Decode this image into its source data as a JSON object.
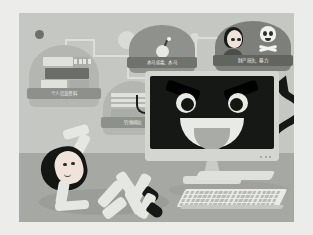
{
  "illustration": {
    "title": "Cyber crime / personal data theft awareness illustration",
    "scene": {
      "wall_color": "#c5c7c3",
      "floor_color": "#a6a8a4",
      "border_color": "#ececeb"
    },
    "monitor": {
      "name": "computer-monitor",
      "screen_color": "#161815",
      "frame_color": "#d4d6d1",
      "face": "evil-grinning-face",
      "eye_count": 2,
      "led_count": 3
    },
    "devil_tail": {
      "name": "devil-tail",
      "color": "#161815"
    },
    "badges": [
      {
        "id": "personal-data",
        "icon": "documents-and-card-icon",
        "label": "个人信息资料",
        "bubble_color": "#b4b6b2",
        "banner_color": "#8e908b"
      },
      {
        "id": "phishing",
        "icon": "fishing-hook-icon",
        "label": "钓鱼网站",
        "bubble_color": "#b4b6b2",
        "banner_color": "#8e908b"
      },
      {
        "id": "malware",
        "icon": "bomb-icon",
        "label": "木马病毒、木马",
        "bubble_color": "#9a9c97",
        "banner_color": "#6f726d"
      },
      {
        "id": "victim-harm",
        "icon": "skull-and-victim-icon",
        "label": "财产损失、暴力",
        "bubble_color": "#7c7f7a",
        "banner_color": "#62655f"
      }
    ],
    "connectors": {
      "line_color": "#dcded9",
      "nodes": [
        {
          "id": "node-dark",
          "color": "#6e706c",
          "size": 9
        },
        {
          "id": "node-light",
          "color": "#d9dbd6",
          "size": 16
        },
        {
          "id": "node-light-2",
          "color": "#d9dbd6",
          "size": 9
        }
      ]
    },
    "victim": {
      "name": "fallen-person",
      "hair_color": "#141613",
      "skin_color": "#f0e4da",
      "clothes_color": "#e5e7e2",
      "shoe_color": "#161815",
      "pose": "lying-on-floor"
    },
    "desk_items": [
      {
        "id": "keyboard",
        "icon": "keyboard-icon",
        "color": "#e9ebe6"
      },
      {
        "id": "mousepad",
        "icon": "mousepad-icon",
        "color": "#dfe1dc"
      }
    ]
  }
}
